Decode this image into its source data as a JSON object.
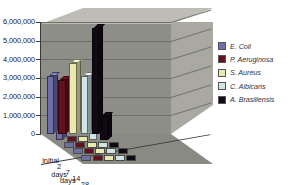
{
  "chart_data": {
    "type": "bar",
    "title": "",
    "subtitle": "",
    "xlabel": "",
    "ylabel": "",
    "categories": [
      "initial",
      "2 days",
      "7 days",
      "14 days",
      "28 days"
    ],
    "ylim": [
      0,
      6000000
    ],
    "ytick_labels": [
      "0",
      "1,000,000",
      "2,000,000",
      "3,000,000",
      "4,000,000",
      "5,000,000",
      "6,000,000"
    ],
    "ytick_values": [
      0,
      1000000,
      2000000,
      3000000,
      4000000,
      5000000,
      6000000
    ],
    "grid": true,
    "legend_position": "right",
    "style": "3d-clustered-column",
    "series": [
      {
        "name": "E. Coli",
        "color": "#6f6fa8",
        "values": [
          3100000,
          1000000,
          0,
          0,
          0
        ]
      },
      {
        "name": "P. Aeruginosa",
        "color": "#63101f",
        "values": [
          2900000,
          0,
          0,
          0,
          0
        ]
      },
      {
        "name": "S. Aureus",
        "color": "#e9e9b0",
        "values": [
          3800000,
          0,
          0,
          0,
          0
        ]
      },
      {
        "name": "C. Albicans",
        "color": "#cfe4e4",
        "values": [
          3100000,
          400000,
          0,
          0,
          0
        ]
      },
      {
        "name": "A. Brasiliensis",
        "color": "#110a14",
        "values": [
          5700000,
          1300000,
          0,
          0,
          0
        ]
      }
    ]
  },
  "legend": {
    "items": [
      {
        "label": "E. Coli",
        "color": "#6f6fa8"
      },
      {
        "label": "P. Aeruginosa",
        "color": "#63101f"
      },
      {
        "label": "S. Aureus",
        "color": "#e9e9b0"
      },
      {
        "label": "C. Albicans",
        "color": "#cfe4e4"
      },
      {
        "label": "A. Brasiliensis",
        "color": "#110a14"
      }
    ]
  },
  "axes": {
    "y_labels": [
      "6,000,000",
      "5,000,000",
      "4,000,000",
      "3,000,000",
      "2,000,000",
      "1,000,000",
      "0"
    ],
    "x_labels": [
      "initial",
      "2 days",
      "7 days",
      "14 days",
      "28 days"
    ]
  },
  "colors": {
    "back_wall": "#8e8e88",
    "side_wall": "#a9a9a2",
    "wall_cap": "#bdbdb6",
    "floor": "#8a8a84",
    "gridline": "#6e6e68",
    "axis": "#3a3a3a",
    "text": "#1a1a1a",
    "legend_text": "#33343a",
    "background": "#ffffff"
  }
}
